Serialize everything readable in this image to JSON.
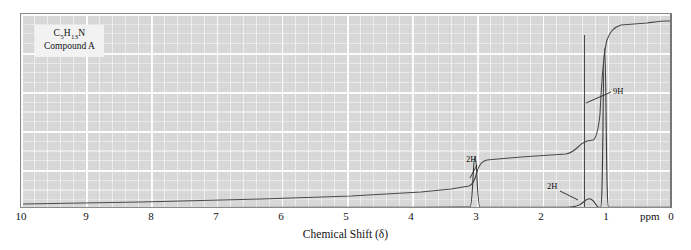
{
  "figure": {
    "name": "proton-nmr-spectrum",
    "annotation": {
      "formula": "C5H13N",
      "formula_parts": {
        "pre": "C",
        "sub1": "5",
        "mid": "H",
        "sub2": "13",
        "post": "N"
      },
      "compound": "Compound A"
    },
    "axis": {
      "title": "Chemical Shift (δ)",
      "unit": "ppm",
      "ticks": [
        "10",
        "9",
        "8",
        "7",
        "6",
        "5",
        "4",
        "3",
        "2",
        "1",
        "0"
      ]
    },
    "peak_labels": [
      {
        "text": "9H",
        "shift": 0.9
      },
      {
        "text": "2H",
        "shift": 2.4
      },
      {
        "text": "2H",
        "shift": 1.25
      }
    ],
    "colors": {
      "plot_background": "#d9d9d9",
      "gridline": "#ffffff",
      "trace": "#3a3a3a",
      "frame": "#8a8a8a",
      "text": "#111111"
    }
  },
  "chart_data": {
    "type": "line",
    "title": "",
    "xlabel": "Chemical Shift (δ)",
    "ylabel": "",
    "xlim": [
      10,
      0
    ],
    "ylim": [
      0,
      1
    ],
    "grid": true,
    "legend": null,
    "axis_unit": "ppm",
    "xticks": [
      10,
      9,
      8,
      7,
      6,
      5,
      4,
      3,
      2,
      1,
      0
    ],
    "series": [
      {
        "name": "spectrum",
        "description": "1H NMR absorption trace, flat baseline with three signals",
        "peaks": [
          {
            "shift": 2.4,
            "integration": "2H",
            "relative_height": 0.22,
            "assignment": "NH2 / CH2-N",
            "multiplicity": "broad singlet"
          },
          {
            "shift": 1.25,
            "integration": "2H",
            "relative_height": 0.06,
            "assignment": "CH2",
            "multiplicity": "multiplet"
          },
          {
            "shift": 0.9,
            "integration": "9H",
            "relative_height": 1.0,
            "assignment": "C(CH3)3",
            "multiplicity": "singlet"
          }
        ]
      },
      {
        "name": "integration",
        "description": "Stepped integral trace rising right-to-left in proportion to proton counts",
        "steps": [
          {
            "shift": 2.4,
            "rise": "2H"
          },
          {
            "shift": 1.25,
            "rise": "2H"
          },
          {
            "shift": 0.9,
            "rise": "9H"
          }
        ]
      }
    ]
  }
}
